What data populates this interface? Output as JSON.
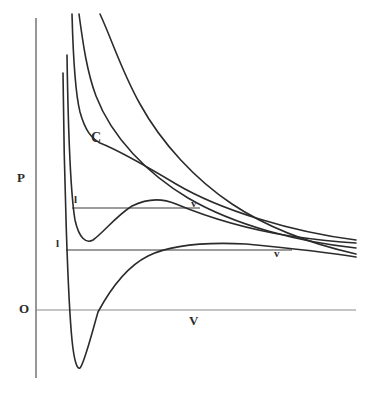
{
  "figure": {
    "kind": "van-der-Waals-isotherm-diagram",
    "background_color": "#ffffff",
    "ink_color": "#2b2b2b",
    "axis_color": "#5a5a5a"
  },
  "labels": {
    "pressure_axis": "P",
    "origin": "O",
    "volume_axis": "V",
    "critical_point": "C",
    "liquid_upper": "l",
    "vapour_upper": "v",
    "liquid_lower": "l",
    "vapour_lower": "v"
  },
  "chart_data": {
    "type": "line",
    "title": "",
    "xlabel": "V",
    "ylabel": "P",
    "grid": false,
    "legend": "none",
    "axis_origin_label": "O",
    "xlim": [
      0,
      368
    ],
    "ylim": [
      395,
      0
    ],
    "annotations": [
      {
        "text": "C",
        "x": 95,
        "y": 137,
        "meaning": "critical point"
      },
      {
        "text": "l",
        "x": 78,
        "y": 199,
        "meaning": "liquid endpoint of upper tie line"
      },
      {
        "text": "v",
        "x": 195,
        "y": 203,
        "meaning": "vapour endpoint of upper tie line"
      },
      {
        "text": "l",
        "x": 60,
        "y": 243,
        "meaning": "liquid endpoint of lower tie line"
      },
      {
        "text": "v",
        "x": 278,
        "y": 253,
        "meaning": "vapour endpoint of lower tie line"
      }
    ],
    "axes": {
      "vertical": {
        "x": 36,
        "y_top": 18,
        "y_bottom": 378
      },
      "horizontal": {
        "y": 310,
        "x_left": 36,
        "x_right": 356
      }
    },
    "tie_lines": [
      {
        "name": "upper-tie-line",
        "y": 208,
        "x_start": 72,
        "x_end": 200
      },
      {
        "name": "lower-tie-line",
        "y": 250,
        "x_start": 66,
        "x_end": 292
      }
    ],
    "series": [
      {
        "name": "isotherm-supercritical-highest",
        "description": "topmost supercritical isotherm, monotonically decreasing hyperbola",
        "path": "M 100,14 C 112,40 122,72 140,104 C 162,144 196,180 232,204 C 268,228 312,244 356,254"
      },
      {
        "name": "isotherm-supercritical-upper",
        "description": "second supercritical isotherm",
        "path": "M 79,14 C 83,44 87,72 96,96 C 112,138 148,174 188,198 C 236,226 300,242 356,248"
      },
      {
        "name": "isotherm-critical",
        "description": "critical isotherm with inflection point C at the critical point",
        "path": "M 72,14 C 73,52 75,92 80,112 C 85,130 91,138 100,143 C 118,150 146,166 176,184 C 220,210 292,232 356,240"
      },
      {
        "name": "isotherm-subcritical-upper",
        "description": "subcritical isotherm with van der Waals loop; tie line l-v at P = upper tie line",
        "path": "M 67,55 C 68,120 70,190 75,220 C 79,238 86,244 93,240 C 104,232 116,216 132,206 C 148,198 162,198 176,204 C 200,214 240,228 290,236 C 318,240 338,242 356,243"
      },
      {
        "name": "isotherm-subcritical-lower",
        "description": "lowest subcritical isotherm with deep van der Waals loop dipping below the V axis; tie line l-v at P = lower tie line",
        "path": "M 63,73 C 64,180 68,300 72,340 C 74,360 77,370 80,368 C 84,364 90,340 98,312 C 112,286 128,266 148,256 C 172,244 206,242 246,244 C 288,248 326,252 356,257"
      }
    ],
    "curve_endpoints_right_edge": {
      "x": 356,
      "y_values": [
        254,
        248,
        240,
        243,
        257
      ]
    }
  }
}
